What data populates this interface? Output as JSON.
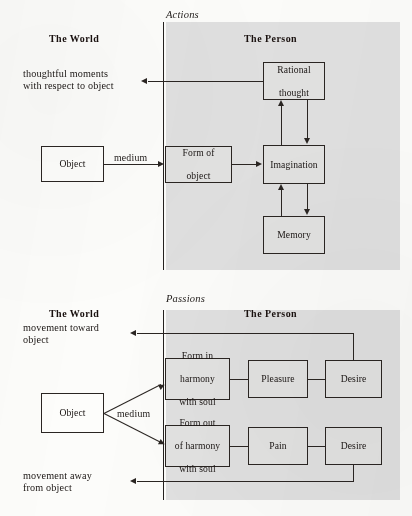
{
  "figure_top": {
    "section_label": "Actions",
    "world_header": "The World",
    "person_header": "The Person",
    "output_text_line1": "thoughtful moments",
    "output_text_line2": "with respect to object",
    "object_box": "Object",
    "medium_label": "medium",
    "boxes": {
      "form_of_object_line1": "Form of",
      "form_of_object_line2": "object",
      "rational_thought_line1": "Rational",
      "rational_thought_line2": "thought",
      "imagination": "Imagination",
      "memory": "Memory"
    }
  },
  "figure_bottom": {
    "section_label": "Passions",
    "world_header": "The World",
    "person_header": "The Person",
    "output_toward_line1": "movement toward",
    "output_toward_line2": "object",
    "output_away_line1": "movement away",
    "output_away_line2": "from object",
    "object_box": "Object",
    "medium_label": "medium",
    "boxes": {
      "form_in_harmony_line1": "Form in",
      "form_in_harmony_line2": "harmony",
      "form_in_harmony_line3": "with soul",
      "form_out_harmony_line1": "Form out",
      "form_out_harmony_line2": "of harmony",
      "form_out_harmony_line3": "with soul",
      "pleasure": "Pleasure",
      "pain": "Pain",
      "desire_upper": "Desire",
      "desire_lower": "Desire"
    }
  },
  "colors": {
    "panel_gray": "#dedede",
    "box_gray": "#e2e2e1",
    "box_white": "#fdfdfb",
    "ink": "#2a2522",
    "paper": "#fcfcfa"
  }
}
